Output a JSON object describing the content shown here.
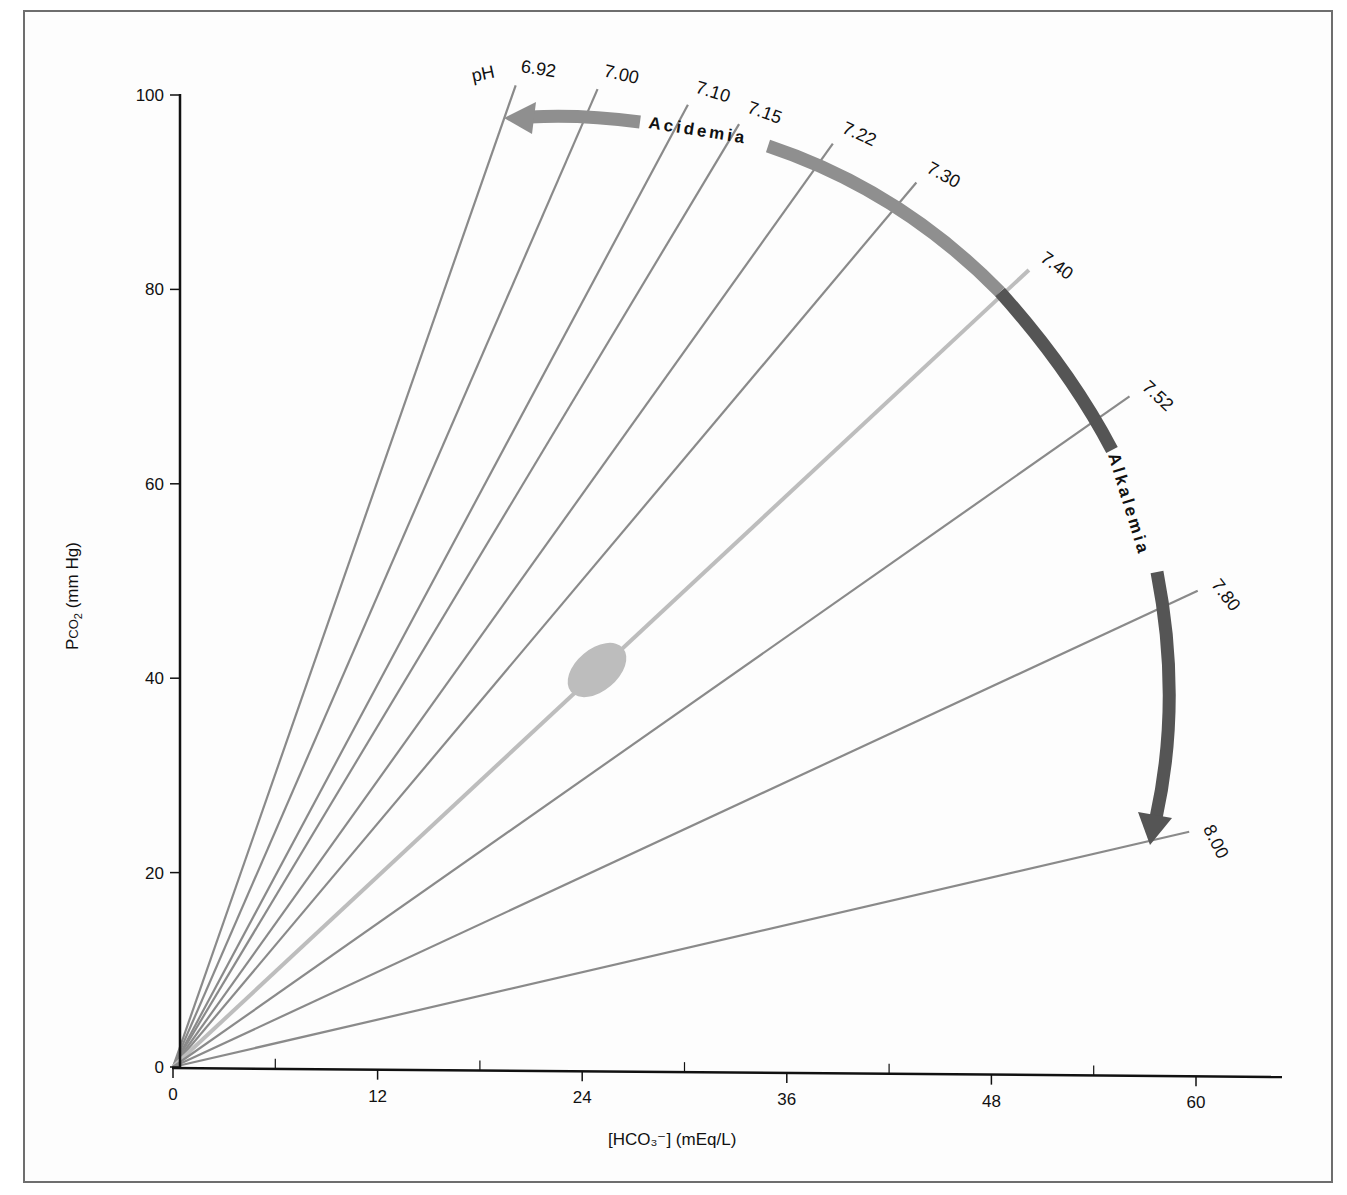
{
  "chart_data": {
    "type": "line",
    "title": "",
    "xlabel": "[HCO3−] (mEq/L)",
    "ylabel": "PCO2 (mm Hg)",
    "xlim": [
      0,
      64
    ],
    "ylim": [
      0,
      100
    ],
    "x_ticks": [
      0,
      12,
      24,
      36,
      48,
      60
    ],
    "x_minor_ticks": [
      6,
      18,
      30,
      42,
      54
    ],
    "y_ticks": [
      0,
      20,
      40,
      60,
      80,
      100
    ],
    "grid": false,
    "ph_prefix": "pH",
    "series": [
      {
        "name": "6.92",
        "x": [
          0,
          20.1
        ],
        "y": [
          0,
          101.0
        ],
        "color": "#8a8a8a"
      },
      {
        "name": "7.00",
        "x": [
          0,
          24.9
        ],
        "y": [
          0,
          100.6
        ],
        "color": "#8a8a8a"
      },
      {
        "name": "7.10",
        "x": [
          0,
          30.2
        ],
        "y": [
          0,
          99.0
        ],
        "color": "#8a8a8a"
      },
      {
        "name": "7.15",
        "x": [
          0,
          33.2
        ],
        "y": [
          0,
          97.0
        ],
        "color": "#8a8a8a"
      },
      {
        "name": "7.22",
        "x": [
          0,
          38.7
        ],
        "y": [
          0,
          95.0
        ],
        "color": "#8a8a8a"
      },
      {
        "name": "7.30",
        "x": [
          0,
          43.6
        ],
        "y": [
          0,
          91.0
        ],
        "color": "#8a8a8a"
      },
      {
        "name": "7.40",
        "x": [
          0,
          50.2
        ],
        "y": [
          0,
          82.0
        ],
        "color": "#bdbdbd"
      },
      {
        "name": "7.52",
        "x": [
          0,
          56.1
        ],
        "y": [
          0,
          69.0
        ],
        "color": "#8a8a8a"
      },
      {
        "name": "7.80",
        "x": [
          0,
          60.1
        ],
        "y": [
          0,
          49.0
        ],
        "color": "#8a8a8a"
      },
      {
        "name": "8.00",
        "x": [
          0,
          59.6
        ],
        "y": [
          0,
          24.2
        ],
        "color": "#8a8a8a"
      }
    ],
    "normal_region": {
      "center_x": 24.7,
      "center_y": 39.8,
      "on_line": "7.40",
      "color": "#bdbdbd"
    },
    "annotations": [
      {
        "text": "Acidemia",
        "type": "curved-arrow",
        "direction": "toward lower pH (counter-clockwise)",
        "color": "#8f8f8f"
      },
      {
        "text": "Alkalemia",
        "type": "curved-arrow",
        "direction": "toward higher pH (clockwise)",
        "color": "#555555"
      }
    ],
    "legend": null
  },
  "labels": {
    "ph_prefix": "pH",
    "acidemia": "Acidemia",
    "alkalemia": "Alkalemia",
    "x_axis_title": "[HCO₃⁻] (mEq/L)",
    "y_axis_title_main": "P",
    "y_axis_title_sub": "CO",
    "y_axis_title_sub2": "2",
    "y_axis_title_rest": " (mm Hg)",
    "x_ticks": [
      "0",
      "12",
      "24",
      "36",
      "48",
      "60"
    ],
    "y_ticks": [
      "0",
      "20",
      "40",
      "60",
      "80",
      "100"
    ],
    "ph_values": [
      "6.92",
      "7.00",
      "7.10",
      "7.15",
      "7.22",
      "7.30",
      "7.40",
      "7.52",
      "7.80",
      "8.00"
    ]
  },
  "colors": {
    "isopleth": "#8a8a8a",
    "normal_line": "#bdbdbd",
    "acid_arc": "#8f8f8f",
    "alk_arc": "#555555",
    "axis": "#111111",
    "frame": "#6e6e6e"
  }
}
